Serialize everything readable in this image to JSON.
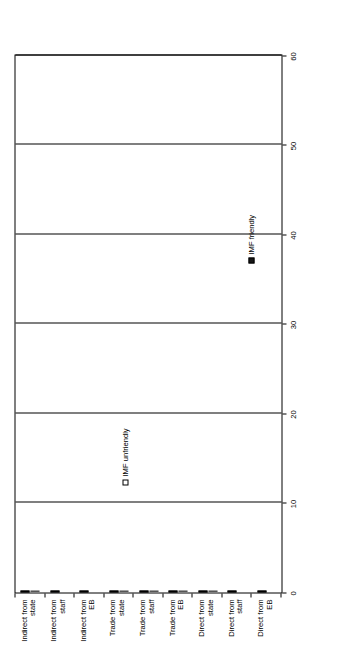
{
  "chart_data": {
    "type": "bar",
    "orientation": "horizontal",
    "title": "",
    "subtitle": "",
    "xlabel": "",
    "ylabel": "",
    "xlim": [
      0,
      60
    ],
    "xticks": [
      0,
      10,
      20,
      30,
      40,
      50,
      60
    ],
    "xtick_labels": [
      "0",
      "10",
      "20",
      "30",
      "40",
      "50",
      "60"
    ],
    "grid": true,
    "grid_axis": "x",
    "legend_position": "right-inside",
    "categories": [
      "Indirect from state",
      "Indirect from staff",
      "Indirect from EB",
      "Trade from state",
      "Trade from staff",
      "Trade from EB",
      "Direct from state",
      "Direct from staff",
      "Direct from EB"
    ],
    "series": [
      {
        "name": "IMF friendly",
        "color": "#171717",
        "values": [
          51,
          51,
          18,
          33.5,
          40,
          18.5,
          48,
          44,
          24.5
        ]
      },
      {
        "name": "IMF unfriendly",
        "color": "#d4d4d4",
        "values": [
          1.5,
          0,
          0,
          32.5,
          10,
          6,
          4,
          0,
          0
        ]
      }
    ]
  },
  "legend": {
    "items": [
      {
        "label": "IMF friendly",
        "swatch": "filled-square-icon"
      },
      {
        "label": "IMF unfriendly",
        "swatch": "empty-square-icon"
      }
    ]
  }
}
